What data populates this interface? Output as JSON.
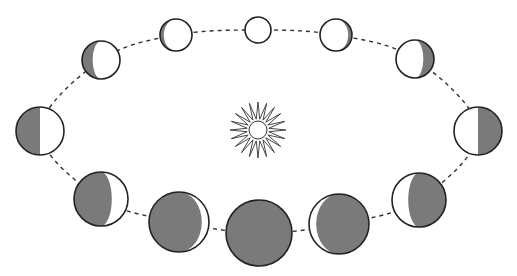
{
  "diagram": {
    "title": "Phases of Venus orbiting the Sun",
    "colors": {
      "background": "#ffffff",
      "shadow": "#7a7a7a",
      "outline": "#222222",
      "orbit": "#333333"
    },
    "sun": {
      "icon": "sun-icon",
      "cx": 258,
      "cy": 130,
      "rays": 20,
      "inner_r": 12,
      "outer_r": 28
    },
    "orbit": {
      "cx": 258,
      "cy": 130,
      "rx": 228,
      "ry": 100,
      "style": "dashed"
    },
    "phases": [
      {
        "name": "full",
        "cx": 258,
        "cy": 30,
        "r": 13,
        "dark_side": "none",
        "lit_fraction": 1.0
      },
      {
        "name": "waning-gibbous-1",
        "cx": 336,
        "cy": 35,
        "r": 16,
        "dark_side": "right",
        "lit_fraction": 0.88
      },
      {
        "name": "waning-gibbous-2",
        "cx": 415,
        "cy": 59,
        "r": 19,
        "dark_side": "right",
        "lit_fraction": 0.72
      },
      {
        "name": "last-quarter",
        "cx": 478,
        "cy": 131,
        "r": 24,
        "dark_side": "right",
        "lit_fraction": 0.5
      },
      {
        "name": "waning-crescent-1",
        "cx": 419,
        "cy": 200,
        "r": 27,
        "dark_side": "right",
        "lit_fraction": 0.3
      },
      {
        "name": "waning-crescent-2",
        "cx": 339,
        "cy": 224,
        "r": 30,
        "dark_side": "right",
        "lit_fraction": 0.12
      },
      {
        "name": "new",
        "cx": 259,
        "cy": 233,
        "r": 33,
        "dark_side": "all",
        "lit_fraction": 0.0
      },
      {
        "name": "waxing-crescent-2",
        "cx": 179,
        "cy": 222,
        "r": 30,
        "dark_side": "left",
        "lit_fraction": 0.12
      },
      {
        "name": "waxing-crescent-1",
        "cx": 101,
        "cy": 199,
        "r": 27,
        "dark_side": "left",
        "lit_fraction": 0.3
      },
      {
        "name": "first-quarter",
        "cx": 40,
        "cy": 131,
        "r": 24,
        "dark_side": "left",
        "lit_fraction": 0.5
      },
      {
        "name": "waxing-gibbous-2",
        "cx": 101,
        "cy": 60,
        "r": 19,
        "dark_side": "left",
        "lit_fraction": 0.72
      },
      {
        "name": "waxing-gibbous-1",
        "cx": 176,
        "cy": 35,
        "r": 16,
        "dark_side": "left",
        "lit_fraction": 0.88
      }
    ]
  }
}
